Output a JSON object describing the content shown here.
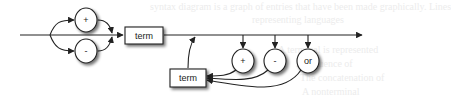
{
  "diagram": {
    "type": "syntax-diagram",
    "nodes": {
      "sign_plus": {
        "label": "+",
        "shape": "circle"
      },
      "sign_minus": {
        "label": "-",
        "shape": "circle"
      },
      "term_first": {
        "label": "term",
        "shape": "box"
      },
      "op_plus": {
        "label": "+",
        "shape": "circle"
      },
      "op_minus": {
        "label": "-",
        "shape": "circle"
      },
      "op_or": {
        "label": "or",
        "shape": "circle"
      },
      "term_loop": {
        "label": "term",
        "shape": "box"
      }
    },
    "colors": {
      "stroke": "#222222",
      "node_fill": "#ffffff",
      "shadow": "#9a9a9a"
    }
  },
  "background_ghost_text": [
    "syntax diagram is a graph of entries that have been made graphically. Lines",
    "representing languages",
    "A terminal is represented",
    "A sequence of",
    "The concatenation of",
    "A nonterminal"
  ]
}
